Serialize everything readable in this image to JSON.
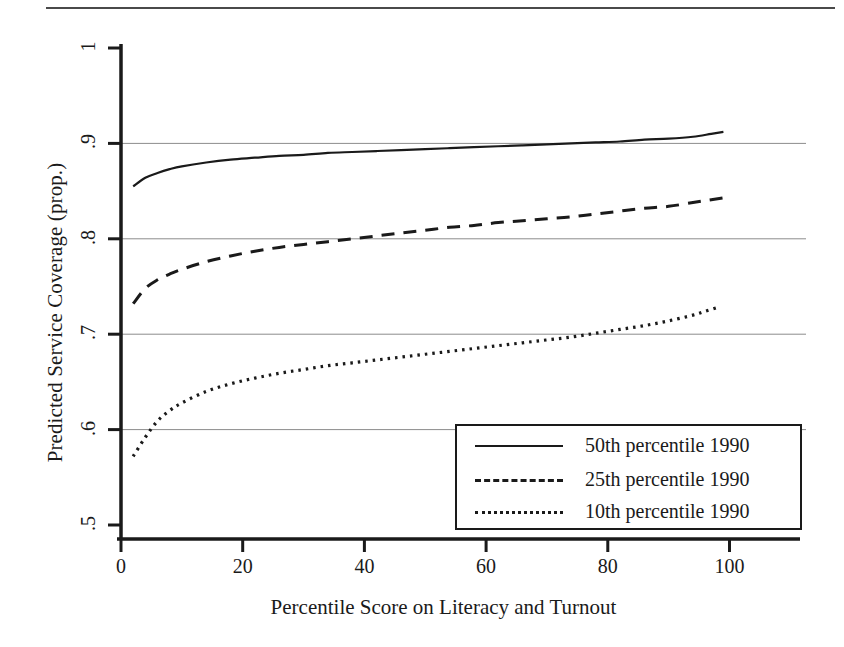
{
  "figure": {
    "has_top_rule": true,
    "background": "#ffffff",
    "ink_color": "#1a1a1a",
    "grid_color": "#8c8c8c"
  },
  "chart_data": {
    "type": "line",
    "title": "",
    "xlabel": "Percentile Score on Literacy and Turnout",
    "ylabel": "Predicted Service Coverage (prop.)",
    "xlim": [
      0,
      106
    ],
    "ylim": [
      0.5,
      1.0
    ],
    "xticks": [
      0,
      20,
      40,
      60,
      80,
      100
    ],
    "xticklabels": [
      "0",
      "20",
      "40",
      "60",
      "80",
      "100"
    ],
    "yticks": [
      0.5,
      0.6,
      0.7,
      0.8,
      0.9,
      1.0
    ],
    "yticklabels": [
      ".5",
      ".6",
      ".7",
      ".8",
      ".9",
      "1"
    ],
    "grid": "horizontal",
    "gridlines_at": [
      0.6,
      0.7,
      0.8,
      0.9
    ],
    "legend_position": "lower right",
    "series": [
      {
        "name": "50th percentile 1990",
        "style": "solid",
        "x": [
          2,
          4,
          6,
          8,
          10,
          14,
          18,
          22,
          26,
          30,
          34,
          38,
          42,
          46,
          50,
          54,
          58,
          62,
          66,
          70,
          74,
          78,
          82,
          86,
          90,
          94,
          97,
          99
        ],
        "y": [
          0.855,
          0.864,
          0.869,
          0.873,
          0.876,
          0.88,
          0.883,
          0.885,
          0.887,
          0.888,
          0.89,
          0.891,
          0.892,
          0.893,
          0.894,
          0.895,
          0.896,
          0.897,
          0.898,
          0.899,
          0.9,
          0.901,
          0.902,
          0.904,
          0.905,
          0.907,
          0.91,
          0.912
        ]
      },
      {
        "name": "25th percentile 1990",
        "style": "dashed",
        "x": [
          2,
          4,
          6,
          8,
          10,
          14,
          18,
          22,
          26,
          30,
          34,
          38,
          42,
          46,
          50,
          54,
          58,
          62,
          66,
          70,
          74,
          78,
          82,
          86,
          90,
          94,
          97,
          99
        ],
        "y": [
          0.732,
          0.748,
          0.757,
          0.763,
          0.768,
          0.776,
          0.782,
          0.787,
          0.791,
          0.794,
          0.797,
          0.8,
          0.803,
          0.806,
          0.809,
          0.812,
          0.814,
          0.817,
          0.819,
          0.821,
          0.823,
          0.826,
          0.829,
          0.832,
          0.834,
          0.838,
          0.841,
          0.843
        ]
      },
      {
        "name": "10th percentile 1990",
        "style": "dotted",
        "x": [
          2,
          4,
          6,
          8,
          10,
          14,
          18,
          22,
          26,
          30,
          34,
          38,
          42,
          46,
          50,
          54,
          58,
          62,
          66,
          70,
          74,
          78,
          82,
          86,
          90,
          94,
          96,
          98
        ],
        "y": [
          0.572,
          0.592,
          0.609,
          0.62,
          0.628,
          0.64,
          0.648,
          0.654,
          0.659,
          0.663,
          0.667,
          0.67,
          0.673,
          0.676,
          0.679,
          0.682,
          0.685,
          0.688,
          0.691,
          0.694,
          0.697,
          0.701,
          0.705,
          0.709,
          0.714,
          0.72,
          0.724,
          0.728
        ]
      }
    ]
  },
  "legend": {
    "entries": [
      {
        "label": "50th percentile 1990",
        "style": "solid"
      },
      {
        "label": "25th percentile 1990",
        "style": "dashed"
      },
      {
        "label": "10th percentile 1990",
        "style": "dotted"
      }
    ]
  }
}
